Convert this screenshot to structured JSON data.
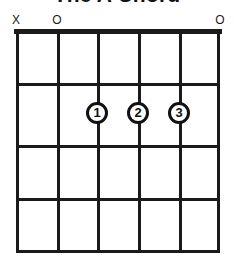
{
  "title": "The A Chord",
  "diagram": {
    "type": "guitar-chord-diagram",
    "strings": 6,
    "frets": 4,
    "colors": {
      "ink": "#1a1a1a",
      "background": "#ffffff"
    },
    "string_markers": [
      {
        "label": "X",
        "string": 1,
        "meaning": "muted",
        "x": 16
      },
      {
        "label": "O",
        "string": 2,
        "meaning": "open",
        "x": 57
      },
      {
        "label": "O",
        "string": 6,
        "meaning": "open",
        "x": 220
      }
    ],
    "string_positions": [
      16,
      57,
      97,
      138,
      179,
      220
    ],
    "fret_positions": [
      29,
      83,
      145,
      198,
      253
    ],
    "fingerings": [
      {
        "label": "1",
        "string": 3,
        "fret": 2,
        "x": 97,
        "y": 113
      },
      {
        "label": "2",
        "string": 4,
        "fret": 2,
        "x": 138,
        "y": 113
      },
      {
        "label": "3",
        "string": 5,
        "fret": 2,
        "x": 179,
        "y": 113
      }
    ]
  }
}
